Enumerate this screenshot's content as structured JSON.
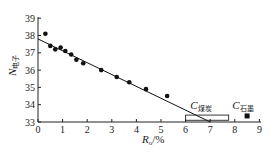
{
  "chart_data": {
    "type": "scatter",
    "title": "",
    "xlabel": "R",
    "xlabel_sub": "o",
    "xlabel_suffix": "/%",
    "ylabel": "N",
    "ylabel_sub": "电子",
    "xlim": [
      0,
      9
    ],
    "ylim": [
      33,
      39
    ],
    "xticks": [
      0,
      1,
      2,
      3,
      4,
      5,
      6,
      7,
      8,
      9
    ],
    "yticks": [
      33,
      34,
      35,
      36,
      37,
      38,
      39
    ],
    "grid": false,
    "legend": null,
    "series": [
      {
        "name": "samples",
        "marker": "circle",
        "color": "#111111",
        "points": [
          {
            "x": 0.3,
            "y": 38.1
          },
          {
            "x": 0.5,
            "y": 37.4
          },
          {
            "x": 0.7,
            "y": 37.2
          },
          {
            "x": 0.92,
            "y": 37.3
          },
          {
            "x": 1.11,
            "y": 37.1
          },
          {
            "x": 1.35,
            "y": 36.9
          },
          {
            "x": 1.56,
            "y": 36.6
          },
          {
            "x": 1.84,
            "y": 36.4
          },
          {
            "x": 2.57,
            "y": 36.0
          },
          {
            "x": 3.2,
            "y": 35.6
          },
          {
            "x": 3.71,
            "y": 35.3
          },
          {
            "x": 4.39,
            "y": 34.9
          },
          {
            "x": 5.25,
            "y": 34.5
          }
        ]
      },
      {
        "name": "fit-line",
        "type": "line",
        "color": "#111111",
        "points": [
          {
            "x": 0.0,
            "y": 37.8
          },
          {
            "x": 7.0,
            "y": 33.0
          }
        ]
      }
    ],
    "annotations": [
      {
        "label": "C",
        "sub": "煤炭",
        "shape": "rectangle",
        "x_range": [
          6.0,
          7.75
        ],
        "y_range": [
          33.1,
          33.4
        ],
        "label_x": 6.6,
        "label_y": 33.9
      },
      {
        "label": "C",
        "sub": "石墨",
        "shape": "square",
        "x": 8.5,
        "y": 33.35,
        "label_x": 8.1,
        "label_y": 33.9
      }
    ]
  }
}
